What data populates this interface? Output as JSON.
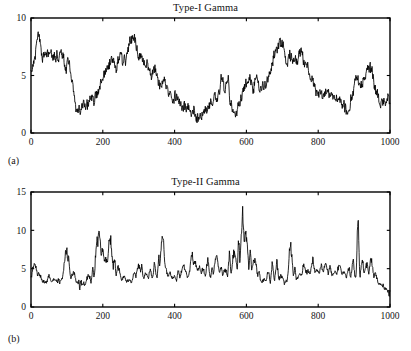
{
  "figure": {
    "background": "#ffffff",
    "line_color": "#000000",
    "text_color": "#141414"
  },
  "panels": [
    {
      "id": "a",
      "caption": "(a)",
      "title": "Type-I Gamma"
    },
    {
      "id": "b",
      "caption": "(b)",
      "title": "Type-II Gamma"
    }
  ],
  "chart_data": [
    {
      "type": "line",
      "title": "Type-I Gamma",
      "panel_label": "(a)",
      "xlabel": "",
      "ylabel": "",
      "xlim": [
        0,
        1000
      ],
      "ylim": [
        0,
        10
      ],
      "xticks": [
        0,
        200,
        400,
        600,
        800,
        1000
      ],
      "yticks": [
        0,
        5,
        10
      ],
      "xtick_labels": [
        "0",
        "200",
        "400",
        "600",
        "800",
        "1000"
      ],
      "ytick_labels": [
        "0",
        "5",
        "10"
      ],
      "grid": false,
      "legend": null,
      "series_name": "Type-I Gamma",
      "n_points": 1000,
      "description": "Slowly varying correlated gamma process, baseline drifting between about 1.3 and 8.8",
      "control_x": [
        0,
        8,
        20,
        32,
        45,
        60,
        75,
        88,
        97,
        105,
        115,
        125,
        135,
        145,
        155,
        165,
        175,
        188,
        200,
        212,
        225,
        238,
        248,
        256,
        265,
        275,
        288,
        300,
        312,
        325,
        335,
        345,
        358,
        370,
        385,
        400,
        415,
        428,
        440,
        452,
        462,
        472,
        485,
        498,
        510,
        522,
        532,
        540,
        548,
        556,
        568,
        580,
        592,
        605,
        618,
        630,
        642,
        655,
        665,
        672,
        680,
        690,
        700,
        712,
        722,
        732,
        742,
        752,
        762,
        772,
        785,
        798,
        812,
        825,
        838,
        852,
        862,
        872,
        882,
        892,
        905,
        918,
        930,
        940,
        950,
        962,
        975,
        988,
        1000
      ],
      "control_y": [
        5.4,
        6.2,
        8.8,
        6.6,
        6.9,
        7.0,
        6.6,
        7.0,
        5.5,
        6.3,
        4.3,
        2.3,
        2.0,
        2.6,
        2.1,
        2.6,
        3.0,
        3.6,
        4.6,
        5.6,
        6.2,
        5.6,
        6.6,
        5.9,
        6.5,
        7.6,
        8.3,
        6.7,
        6.4,
        5.8,
        4.6,
        5.6,
        4.2,
        4.6,
        3.6,
        3.2,
        2.7,
        2.4,
        2.2,
        1.9,
        1.4,
        1.6,
        2.0,
        2.6,
        3.0,
        3.4,
        4.7,
        4.0,
        4.7,
        2.4,
        1.6,
        2.6,
        3.6,
        4.7,
        4.2,
        4.6,
        3.8,
        4.2,
        5.1,
        6.3,
        7.0,
        7.8,
        7.9,
        6.3,
        6.9,
        6.0,
        6.4,
        7.3,
        6.0,
        5.6,
        4.4,
        3.4,
        3.2,
        3.5,
        2.9,
        3.0,
        2.6,
        2.2,
        1.8,
        3.0,
        4.7,
        4.2,
        4.8,
        5.9,
        5.2,
        3.4,
        2.5,
        2.7,
        3.0
      ],
      "noise_amplitude": 0.42,
      "random_seed": 17
    },
    {
      "type": "line",
      "title": "Type-II Gamma",
      "panel_label": "(b)",
      "xlabel": "",
      "ylabel": "",
      "xlim": [
        0,
        1000
      ],
      "ylim": [
        0,
        15
      ],
      "xticks": [
        0,
        200,
        400,
        600,
        800,
        1000
      ],
      "yticks": [
        0,
        5,
        10,
        15
      ],
      "xtick_labels": [
        "0",
        "200",
        "400",
        "600",
        "800",
        "1000"
      ],
      "ytick_labels": [
        "0",
        "5",
        "10",
        "15"
      ],
      "grid": false,
      "legend": null,
      "series_name": "Type-II Gamma",
      "n_points": 1000,
      "description": "Spiky gamma process with baseline near 3 and intermittent bursts; largest spike about 12 near x=590",
      "baseline": 3.0,
      "baseline_control_x": [
        0,
        50,
        100,
        150,
        200,
        250,
        300,
        350,
        400,
        450,
        500,
        550,
        600,
        650,
        700,
        750,
        800,
        850,
        900,
        950,
        1000
      ],
      "baseline_control_y": [
        3.3,
        3.1,
        3.4,
        2.7,
        3.6,
        3.0,
        3.2,
        3.6,
        3.1,
        3.8,
        3.6,
        3.5,
        3.8,
        3.0,
        2.8,
        3.4,
        3.8,
        3.6,
        3.5,
        3.1,
        2.0
      ],
      "spikes_x": [
        10,
        22,
        50,
        66,
        80,
        98,
        104,
        118,
        140,
        160,
        172,
        183,
        190,
        198,
        208,
        220,
        232,
        243,
        258,
        272,
        288,
        300,
        308,
        320,
        332,
        344,
        356,
        366,
        374,
        386,
        398,
        410,
        424,
        436,
        448,
        456,
        468,
        478,
        492,
        504,
        516,
        528,
        540,
        552,
        566,
        578,
        589,
        598,
        610,
        622,
        634,
        648,
        660,
        672,
        684,
        696,
        710,
        722,
        734,
        748,
        760,
        772,
        784,
        796,
        808,
        820,
        832,
        846,
        858,
        870,
        884,
        896,
        910,
        922,
        934,
        946,
        958,
        970,
        984,
        996
      ],
      "spikes_y": [
        5.7,
        4.3,
        4.0,
        3.6,
        3.2,
        7.4,
        6.6,
        4.6,
        2.8,
        4.2,
        5.0,
        8.9,
        10.1,
        7.6,
        6.3,
        8.8,
        6.2,
        5.3,
        4.0,
        3.4,
        4.5,
        5.4,
        5.3,
        4.4,
        4.8,
        5.7,
        6.5,
        9.1,
        5.2,
        4.4,
        4.0,
        4.8,
        5.3,
        3.7,
        6.9,
        5.8,
        5.1,
        4.9,
        6.2,
        5.0,
        6.4,
        5.1,
        4.9,
        6.7,
        7.2,
        8.6,
        12.0,
        9.4,
        7.0,
        6.3,
        4.4,
        3.5,
        4.6,
        6.0,
        5.9,
        4.0,
        3.4,
        8.1,
        5.1,
        4.4,
        5.4,
        4.7,
        6.2,
        5.0,
        5.3,
        5.6,
        5.2,
        4.7,
        5.6,
        4.6,
        5.0,
        6.0,
        11.3,
        6.2,
        5.4,
        6.0,
        4.3,
        3.0,
        2.4,
        1.6
      ],
      "noise_amplitude": 0.5,
      "random_seed": 41
    }
  ]
}
